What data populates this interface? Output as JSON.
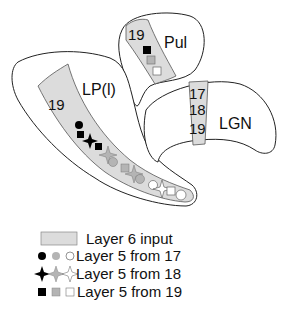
{
  "regions": {
    "pul": {
      "name": "Pul",
      "band_label": "19"
    },
    "lp": {
      "name": "LP(l)",
      "band_label": "19"
    },
    "lgn": {
      "name": "LGN",
      "band_labels": [
        "17",
        "18",
        "19"
      ]
    }
  },
  "colors": {
    "band_fill": "#dcdcdc",
    "black": "#000000",
    "gray": "#b4b4b4",
    "white": "#ffffff"
  },
  "legend": {
    "items": [
      {
        "symbol": "gray-band",
        "label": "Layer 6 input"
      },
      {
        "symbol": "circle",
        "label": "Layer 5 from 17"
      },
      {
        "symbol": "star",
        "label": "Layer 5 from 18"
      },
      {
        "symbol": "square",
        "label": "Layer 5 from 19"
      }
    ]
  }
}
